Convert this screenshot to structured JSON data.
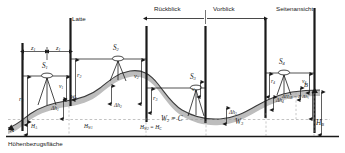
{
  "figure": {
    "kind": "surveying-levelling-profile",
    "language": "de",
    "datum_label": "Höhenbezugsfläche",
    "rod_label": "Latte",
    "backsight_label": "Rückblick",
    "foresight_label": "Vorblick",
    "sideview_label": "Seitenansicht",
    "colors": {
      "line": "#1a1a1a",
      "terrain_fill": "#b8b8b8",
      "terrain_stroke": "#3a3a3a",
      "dashed": "#9a9a9a",
      "text": "#1a1a1a",
      "background": "#ffffff"
    }
  },
  "points": {
    "start": "A",
    "end": "B",
    "turning_points": [
      "W",
      "W",
      "W"
    ],
    "turning_point_1": "W",
    "turning_point_1_sub": "1",
    "turning_point_2_eq": "= C",
    "turning_point_3_sub": "3"
  },
  "instruments": [
    {
      "name": "S",
      "index": "1"
    },
    {
      "name": "S",
      "index": "2"
    },
    {
      "name": "S",
      "index": "3"
    },
    {
      "name": "S",
      "index": "4"
    }
  ],
  "distances": [
    {
      "name": "z",
      "index": "1"
    },
    {
      "name": "z",
      "index": "1"
    }
  ],
  "backsights": [
    {
      "name": "r",
      "index": "1"
    },
    {
      "name": "r",
      "index": "2"
    },
    {
      "name": "r",
      "index": "3"
    },
    {
      "name": "r",
      "index": "4"
    }
  ],
  "foresights": [
    {
      "name": "v",
      "index": "1"
    },
    {
      "name": "v",
      "index": "2"
    },
    {
      "name": "v",
      "index": "3"
    },
    {
      "name": "v",
      "index": "4"
    }
  ],
  "height_differences": [
    {
      "name": "Δh",
      "index": "1"
    },
    {
      "name": "Δh",
      "index": "2"
    },
    {
      "name": "Δh",
      "index": "3"
    },
    {
      "name": "Δh",
      "index": "4"
    }
  ],
  "heights": {
    "H_A": {
      "name": "H",
      "index": "A"
    },
    "H_W1": {
      "name": "H",
      "index": "W1"
    },
    "H_W2_eq_H_C": {
      "name": "H",
      "index": "W2",
      "equals": "= H",
      "equals_index": "C"
    },
    "H_B": {
      "name": "H",
      "index": "B"
    },
    "total": {
      "text": "ΔH",
      "index": "AB",
      "equals": "= Σ Δh",
      "equals_index": "i"
    }
  },
  "text_labels": {
    "z1_left": "z",
    "z1_left_sub": "1",
    "z1_right": "z",
    "z1_right_sub": "1",
    "S1": "S",
    "S1_sub": "1",
    "S2": "S",
    "S2_sub": "2",
    "S3": "S",
    "S3_sub": "3",
    "S4": "S",
    "S4_sub": "4",
    "r1": "r",
    "r1_sub": "1",
    "r2": "r",
    "r2_sub": "2",
    "r3": "r",
    "r3_sub": "3",
    "r4": "r",
    "r4_sub": "4",
    "v1": "v",
    "v1_sub": "1",
    "v2": "v",
    "v2_sub": "2",
    "v3": "v",
    "v3_sub": "3",
    "v4": "v",
    "v4_sub": "4",
    "dh1": "Δh",
    "dh1_sub": "1",
    "dh2": "Δh",
    "dh2_sub": "2",
    "dh3": "Δh",
    "dh3_sub": "3",
    "dh4": "Δh",
    "dh4_sub": "4",
    "A": "A",
    "B": "B",
    "W1": "W",
    "W1_sub": "1",
    "W2": "W",
    "W2_sub": "2",
    "W2_eq": " = C",
    "W3": "W",
    "W3_sub": "3",
    "HA": "H",
    "HA_sub": "A",
    "HW1": "H",
    "HW1_sub": "W1",
    "HW2": "H",
    "HW2_sub": "W2",
    "HW2_eq": " = H",
    "HW2_eq_sub": "C",
    "HB": "H",
    "HB_sub": "B",
    "dHAB": "ΔH",
    "dHAB_sub": "AB",
    "dHAB_eq": " = Σ Δh",
    "dHAB_eq_sub": "i",
    "Latte": "Latte",
    "Rueckblick": "Rückblick",
    "Vorblick": "Vorblick",
    "Seitenansicht": "Seitenansicht",
    "Hoehenbezugsflaeche": "Höhenbezugsfläche"
  }
}
